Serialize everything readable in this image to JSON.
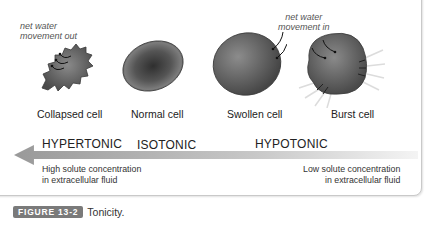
{
  "figure": {
    "label": "FIGURE 13-2",
    "caption": "Tonicity."
  },
  "annotations": {
    "water_out": [
      "net water",
      "movement out"
    ],
    "water_in": [
      "net water",
      "movement in"
    ]
  },
  "cells": [
    {
      "label": "Collapsed cell",
      "state": "crenated"
    },
    {
      "label": "Normal cell",
      "state": "normal"
    },
    {
      "label": "Swollen cell",
      "state": "swollen"
    },
    {
      "label": "Burst cell",
      "state": "lysed"
    }
  ],
  "tonicity": {
    "hypertonic": "HYPERTONIC",
    "isotonic": "ISOTONIC",
    "hypotonic": "HYPOTONIC"
  },
  "concentration": {
    "high": [
      "High solute concentration",
      "in extracellular fluid"
    ],
    "low": [
      "Low solute concentration",
      "in extracellular fluid"
    ]
  },
  "colors": {
    "cell_fill": "#6e6e6e",
    "cell_dark": "#3f3f3f",
    "arrow_dark": "#9a9a9a",
    "arrow_light": "#f2f2f2",
    "badge": "#7a7a7a"
  }
}
